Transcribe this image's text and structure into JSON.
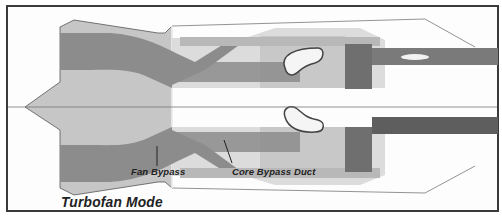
{
  "diagram": {
    "title": "Turbofan Mode",
    "labels": {
      "fan_bypass": "Fan Bypass",
      "core_bypass_duct": "Core Bypass Duct"
    },
    "colors": {
      "frame": "#3a3a3a",
      "nacelle_fill": "#c4c4c4",
      "flow_dark": "#8a8a8a",
      "flow_medium": "#a8a8a8",
      "core_light": "#d6d6d6",
      "exhaust_dark": "#6a6a6a",
      "outline": "#555555",
      "background": "#fdfdfd"
    }
  }
}
